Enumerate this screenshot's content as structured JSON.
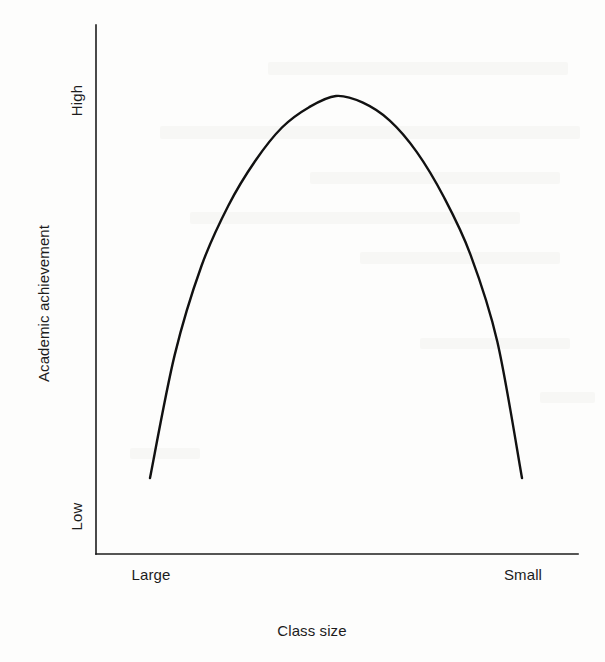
{
  "chart_data": {
    "type": "line",
    "title": "",
    "subtitle": "",
    "xlabel": "Class size",
    "ylabel": "Academic achievement",
    "x_tick_labels": [
      "Large",
      "Small"
    ],
    "y_tick_labels": [
      "High",
      "Low"
    ],
    "grid": false,
    "legend": null,
    "annotations": [],
    "axis_color": "#1c1c1c",
    "curve_color": "#111111",
    "background_color": "#fdfdfc",
    "xlim": [
      "Large",
      "Small"
    ],
    "ylim": [
      "Low",
      "High"
    ],
    "series": [
      {
        "name": "Academic achievement vs class size",
        "shape": "inverted-u",
        "x": [
          0.145,
          0.2,
          0.26,
          0.32,
          0.38,
          0.44,
          0.5,
          0.56,
          0.62,
          0.68,
          0.74,
          0.8,
          0.86,
          0.92,
          0.975
        ],
        "y": [
          0.145,
          0.42,
          0.62,
          0.755,
          0.855,
          0.93,
          0.975,
          1.0,
          0.985,
          0.945,
          0.875,
          0.775,
          0.645,
          0.45,
          0.145
        ],
        "peak": {
          "x": 0.56,
          "y": 1.0
        }
      }
    ]
  },
  "figure": {
    "axis_origin": {
      "x": 96,
      "y": 554
    },
    "y_axis_top": 25,
    "x_axis_right": 578,
    "curve_left_end": {
      "x": 150,
      "y": 478
    },
    "curve_right_end": {
      "x": 522,
      "y": 478
    },
    "curve_peak": {
      "x": 340,
      "y": 96
    }
  }
}
